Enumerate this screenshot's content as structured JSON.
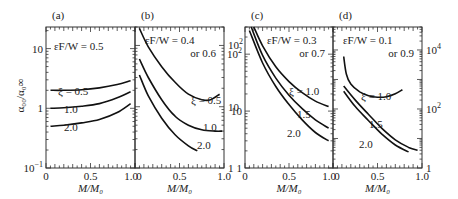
{
  "chart_data": [
    {
      "type": "line",
      "panel_label": "(a)",
      "annotation": "εF/W = 0.5",
      "xlabel": "M/M₀",
      "ylabel": "α₀₀/α₀∞",
      "xlim": [
        0,
        1.0
      ],
      "ylim": [
        0.1,
        23
      ],
      "yscale": "log",
      "y_axis_side": "left",
      "x_tick_labels": [
        "0",
        "0.5",
        "1.0"
      ],
      "y_tick_labels": [
        "10⁻¹",
        "1",
        "10"
      ],
      "series": [
        {
          "name": "ξ = 0.5",
          "label": "ξ = 0.5",
          "x": [
            0.05,
            0.2,
            0.4,
            0.6,
            0.8,
            0.95
          ],
          "y": [
            2.0,
            2.0,
            2.05,
            2.2,
            2.5,
            2.9
          ]
        },
        {
          "name": "ξ = 1.0",
          "label": "1.0",
          "x": [
            0.05,
            0.2,
            0.4,
            0.6,
            0.8,
            0.95
          ],
          "y": [
            1.0,
            1.02,
            1.08,
            1.2,
            1.5,
            1.9
          ]
        },
        {
          "name": "ξ = 2.0",
          "label": "2.0",
          "x": [
            0.05,
            0.2,
            0.4,
            0.6,
            0.8,
            0.95
          ],
          "y": [
            0.5,
            0.52,
            0.57,
            0.65,
            0.85,
            1.2
          ]
        }
      ]
    },
    {
      "type": "line",
      "panel_label": "(b)",
      "annotation": "εF/W = 0.4\nor 0.6",
      "xlabel": "M/M₀",
      "xlim": [
        0,
        1.0
      ],
      "ylim": [
        1,
        200
      ],
      "yscale": "log",
      "y_axis_side": "right",
      "x_tick_labels": [
        "0",
        "0.5",
        "1.0"
      ],
      "y_tick_labels": [
        "1",
        "10",
        "10²"
      ],
      "series": [
        {
          "name": "ξ = 0.5",
          "label": "ξ = 0.5",
          "x": [
            0.05,
            0.15,
            0.3,
            0.45,
            0.6,
            0.75,
            0.85,
            0.95
          ],
          "y": [
            190,
            95,
            45,
            25,
            16,
            13,
            13,
            16
          ]
        },
        {
          "name": "ξ = 1.0",
          "label": "1.0",
          "x": [
            0.05,
            0.15,
            0.3,
            0.45,
            0.6,
            0.75,
            0.9,
            0.98
          ],
          "y": [
            60,
            30,
            13,
            7,
            5,
            4.2,
            4,
            4
          ]
        },
        {
          "name": "ξ = 2.0",
          "label": "2.0",
          "x": [
            0.05,
            0.15,
            0.3,
            0.45,
            0.6,
            0.7
          ],
          "y": [
            33,
            15,
            6.5,
            3.5,
            2.3,
            1.9
          ]
        }
      ]
    },
    {
      "type": "line",
      "panel_label": "(c)",
      "annotation": "εF/W = 0.3\nor 0.7",
      "xlabel": "M/M₀",
      "xlim": [
        0,
        1.0
      ],
      "ylim": [
        1,
        300
      ],
      "yscale": "log",
      "y_axis_side": "left",
      "x_tick_labels": [
        "0",
        "0.5",
        "1.0"
      ],
      "y_tick_labels": [
        "1",
        "10",
        "10²"
      ],
      "series": [
        {
          "name": "ξ = 1.0",
          "label": "ξ = 1.0",
          "x": [
            0.1,
            0.2,
            0.35,
            0.5,
            0.65,
            0.8,
            0.95
          ],
          "y": [
            300,
            140,
            60,
            33,
            21,
            15,
            12
          ]
        },
        {
          "name": "ξ = 1.5",
          "label": "1.5",
          "x": [
            0.07,
            0.2,
            0.35,
            0.5,
            0.65,
            0.8,
            0.95
          ],
          "y": [
            300,
            95,
            38,
            19,
            11,
            7,
            5
          ]
        },
        {
          "name": "ξ = 2.0",
          "label": "2.0",
          "x": [
            0.05,
            0.2,
            0.35,
            0.5,
            0.65,
            0.8,
            0.95
          ],
          "y": [
            260,
            70,
            27,
            13,
            7,
            4.2,
            3
          ]
        }
      ]
    },
    {
      "type": "line",
      "panel_label": "(d)",
      "annotation": "εF/W = 0.1\nor 0.9",
      "xlabel": "M/M₀",
      "xlim": [
        0,
        1.0
      ],
      "ylim": [
        1,
        60000
      ],
      "yscale": "log",
      "y_axis_side": "right",
      "x_tick_labels": [
        "0",
        "0.5",
        "1.0"
      ],
      "y_tick_labels": [
        "1",
        "10²",
        "10⁴"
      ],
      "series": [
        {
          "name": "ξ = 1.0",
          "label": "ξ = 1.0",
          "x": [
            0.12,
            0.15,
            0.2,
            0.3,
            0.4,
            0.5,
            0.6,
            0.7,
            0.78
          ],
          "y": [
            6000,
            1500,
            700,
            380,
            280,
            250,
            260,
            330,
            450
          ]
        },
        {
          "name": "ξ = 1.5",
          "label": "1.5",
          "x": [
            0.12,
            0.25,
            0.4,
            0.55,
            0.7,
            0.85,
            0.95
          ],
          "y": [
            600,
            200,
            65,
            22,
            9,
            5,
            4
          ]
        },
        {
          "name": "ξ = 2.0",
          "label": "2.0",
          "x": [
            0.12,
            0.25,
            0.4,
            0.55,
            0.7,
            0.85
          ],
          "y": [
            400,
            120,
            40,
            14,
            6,
            3.5
          ]
        }
      ]
    }
  ]
}
